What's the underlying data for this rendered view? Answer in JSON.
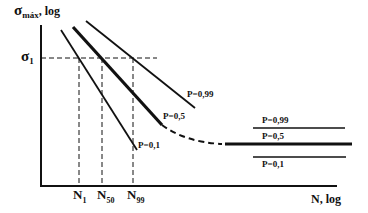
{
  "diagram": {
    "type": "S-N fatigue curves (Wöhler) with probability of failure",
    "y_axis": {
      "label_main": "σ",
      "label_sub": "máx",
      "label_suffix": ", log"
    },
    "x_axis": {
      "label": "N, log"
    },
    "reference_stress": {
      "label_main": "σ",
      "label_sub": "1"
    },
    "n_markers": [
      {
        "main": "N",
        "sub": "1"
      },
      {
        "main": "N",
        "sub": "50"
      },
      {
        "main": "N",
        "sub": "99"
      }
    ],
    "sloped_curves": [
      {
        "label": "P=0,99"
      },
      {
        "label": "P=0,5"
      },
      {
        "label": "P=0,1"
      }
    ],
    "endurance_lines": [
      {
        "label": "P=0,99"
      },
      {
        "label": "P=0,5"
      },
      {
        "label": "P=0,1"
      }
    ]
  },
  "colors": {
    "line": "#111111",
    "background": "#ffffff"
  }
}
